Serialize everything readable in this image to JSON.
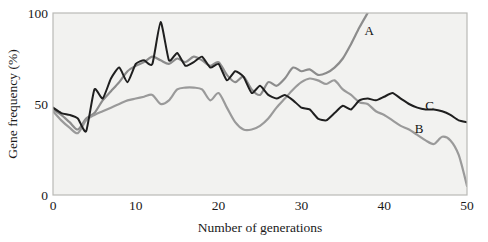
{
  "chart_data": {
    "type": "line",
    "title": "",
    "xlabel": "Number of generations",
    "ylabel": "Gene frequency (%)",
    "xlim": [
      0,
      50
    ],
    "ylim": [
      0,
      100
    ],
    "xticks": [
      0,
      10,
      20,
      30,
      40,
      50
    ],
    "yticks": [
      0,
      50,
      100
    ],
    "xtick_labels": [
      "0",
      "10",
      "20",
      "30",
      "40",
      "50"
    ],
    "ytick_labels": [
      "0",
      "50",
      "100"
    ],
    "grid": false,
    "legend_position": "inline-annotations",
    "plot_background": "#f2f2f0",
    "frame_color": "#b9b9b6",
    "series": [
      {
        "name": "A",
        "label": "A",
        "color": "#8c8c8c",
        "label_x": 38.2,
        "label_y": 88,
        "annotation_note": "light grey curve rising steeply after generation 30 and exiting top of plot near generation 38",
        "x": [
          0,
          1,
          2,
          3,
          4,
          5,
          6,
          7,
          8,
          9,
          10,
          11,
          12,
          13,
          14,
          15,
          16,
          17,
          18,
          19,
          20,
          21,
          22,
          23,
          24,
          25,
          26,
          27,
          28,
          29,
          30,
          31,
          32,
          33,
          34,
          35,
          36,
          37,
          38
        ],
        "y": [
          47,
          44,
          40,
          36,
          42,
          45,
          52,
          57,
          62,
          68,
          71,
          73,
          76,
          74,
          72,
          75,
          73,
          76,
          74,
          71,
          73,
          66,
          62,
          65,
          58,
          55,
          62,
          60,
          64,
          70,
          68,
          69,
          66,
          67,
          70,
          75,
          83,
          92,
          100
        ]
      },
      {
        "name": "B",
        "label": "B",
        "color": "#9a9a9a",
        "label_x": 44.2,
        "label_y": 34,
        "annotation_note": "medium grey curve that rises slowly to a plateau near 60% then declines steadily to about 5% at generation 50",
        "x": [
          0,
          1,
          2,
          3,
          4,
          5,
          6,
          7,
          8,
          9,
          10,
          11,
          12,
          13,
          14,
          15,
          16,
          17,
          18,
          19,
          20,
          21,
          22,
          23,
          24,
          25,
          26,
          27,
          28,
          29,
          30,
          31,
          32,
          33,
          34,
          35,
          36,
          37,
          38,
          39,
          40,
          41,
          42,
          43,
          44,
          45,
          46,
          47,
          48,
          49,
          50
        ],
        "y": [
          46,
          41,
          37,
          34,
          41,
          44,
          46,
          48,
          50,
          52,
          53,
          54,
          55,
          50,
          52,
          58,
          59,
          59,
          58,
          52,
          56,
          48,
          40,
          36,
          36,
          38,
          42,
          48,
          53,
          58,
          62,
          64,
          63,
          61,
          63,
          58,
          55,
          51,
          50,
          46,
          44,
          41,
          38,
          36,
          33,
          30,
          28,
          32,
          30,
          22,
          5
        ]
      },
      {
        "name": "C",
        "label": "C",
        "color": "#1f1f1f",
        "label_x": 45.5,
        "label_y": 47,
        "annotation_note": "dark near-black jagged curve peaking at about 95% at generation 13 then settling near 40% by generation 50",
        "x": [
          0,
          1,
          2,
          3,
          4,
          5,
          6,
          7,
          8,
          9,
          10,
          11,
          12,
          13,
          14,
          15,
          16,
          17,
          18,
          19,
          20,
          21,
          22,
          23,
          24,
          25,
          26,
          27,
          28,
          29,
          30,
          31,
          32,
          33,
          34,
          35,
          36,
          37,
          38,
          39,
          40,
          41,
          42,
          43,
          44,
          45,
          46,
          47,
          48,
          49,
          50
        ],
        "y": [
          48,
          45,
          44,
          42,
          35,
          58,
          53,
          64,
          70,
          62,
          72,
          74,
          72,
          95,
          74,
          78,
          71,
          73,
          76,
          70,
          72,
          63,
          68,
          65,
          56,
          60,
          55,
          53,
          55,
          52,
          48,
          47,
          42,
          41,
          45,
          49,
          47,
          52,
          53,
          52,
          54,
          56,
          53,
          50,
          48,
          47,
          47,
          46,
          44,
          41,
          40
        ]
      }
    ]
  }
}
